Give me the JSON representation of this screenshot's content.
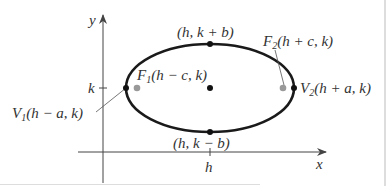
{
  "diagram": {
    "type": "ellipse-horizontal-major-axis",
    "colors": {
      "ellipse": "#1a1a1a",
      "axes": "#444444",
      "vertex_dot": "#111111",
      "focus_dot": "#999999",
      "text": "#333333",
      "frame": "#bbbbbb"
    },
    "axes": {
      "x_label": "x",
      "y_label": "y",
      "x_tick_label": "h",
      "y_tick_label": "k"
    },
    "points": {
      "top": {
        "text": "(h, k + b)"
      },
      "bottom": {
        "text": "(h, k − b)"
      },
      "center": {
        "text": ""
      },
      "focus1": {
        "name": "F",
        "sub": "1",
        "coords": "(h − c, k)"
      },
      "focus2": {
        "name": "F",
        "sub": "2",
        "coords": "(h + c, k)"
      },
      "vertex1": {
        "name": "V",
        "sub": "1",
        "coords": "(h − a, k)"
      },
      "vertex2": {
        "name": "V",
        "sub": "2",
        "coords": "(h + a, k)"
      }
    }
  }
}
